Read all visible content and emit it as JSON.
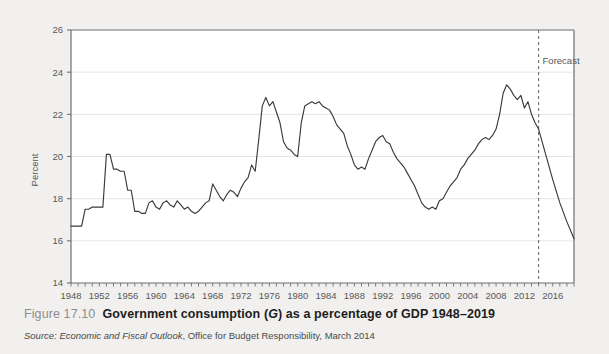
{
  "figure": {
    "number_label": "Figure 17.10",
    "title_part1": "Government consumption (",
    "title_italic": "G",
    "title_part2": ") as a percentage of GDP 1948–2019",
    "title_full": "Government consumption (G) as a percentage of GDP 1948–2019",
    "source_label": "Source:",
    "source_title": "Economic and Fiscal Outlook",
    "source_rest": ", Office for Budget Responsibility, March 2014"
  },
  "colors": {
    "page_background": "#f1f0ee",
    "plot_background": "#ffffff",
    "axis": "#6f6f71",
    "gridline": "#e2e2e2",
    "series_line": "#3a3a3c",
    "forecast_divider": "#6f6f71",
    "tick_label": "#58585a"
  },
  "chart_data": {
    "type": "line",
    "title": "Government consumption (G) as a percentage of GDP 1948–2019",
    "xlabel": "",
    "ylabel": "Percent",
    "xlim": [
      1948,
      2019
    ],
    "ylim": [
      14,
      26
    ],
    "yticks": [
      14,
      16,
      18,
      20,
      22,
      24,
      26
    ],
    "ytick_labels": [
      "14",
      "16",
      "18",
      "20",
      "22",
      "24",
      "26"
    ],
    "xticks": [
      1948,
      1952,
      1956,
      1960,
      1964,
      1968,
      1972,
      1976,
      1980,
      1984,
      1988,
      1992,
      1996,
      2000,
      2004,
      2008,
      2012,
      2016
    ],
    "xtick_labels": [
      "1948",
      "1952",
      "1956",
      "1960",
      "1964",
      "1968",
      "1972",
      "1976",
      "1980",
      "1984",
      "1988",
      "1992",
      "1996",
      "2000",
      "2004",
      "2008",
      "2012",
      "2016"
    ],
    "xtick_minor_step": 1,
    "grid": "horizontal",
    "legend": "none",
    "annotations": [
      {
        "name": "forecast-label",
        "text": "Forecast",
        "x": 2014.0,
        "y": 24.4,
        "kind": "text"
      },
      {
        "name": "forecast-divider",
        "text": "",
        "x": 2014.0,
        "kind": "vertical-dashed-line"
      }
    ],
    "series": [
      {
        "name": "Government consumption as % of GDP",
        "x": [
          1948.0,
          1948.5,
          1949.0,
          1949.5,
          1950.0,
          1950.5,
          1951.0,
          1951.5,
          1952.0,
          1952.5,
          1953.0,
          1953.5,
          1954.0,
          1954.5,
          1955.0,
          1955.5,
          1956.0,
          1956.5,
          1957.0,
          1957.5,
          1958.0,
          1958.5,
          1959.0,
          1959.5,
          1960.0,
          1960.5,
          1961.0,
          1961.5,
          1962.0,
          1962.5,
          1963.0,
          1963.5,
          1964.0,
          1964.5,
          1965.0,
          1965.5,
          1966.0,
          1966.5,
          1967.0,
          1967.5,
          1968.0,
          1968.5,
          1969.0,
          1969.5,
          1970.0,
          1970.5,
          1971.0,
          1971.5,
          1972.0,
          1972.5,
          1973.0,
          1973.5,
          1974.0,
          1974.5,
          1975.0,
          1975.5,
          1976.0,
          1976.5,
          1977.0,
          1977.5,
          1978.0,
          1978.5,
          1979.0,
          1979.5,
          1980.0,
          1980.5,
          1981.0,
          1981.5,
          1982.0,
          1982.5,
          1983.0,
          1983.5,
          1984.0,
          1984.5,
          1985.0,
          1985.5,
          1986.0,
          1986.5,
          1987.0,
          1987.5,
          1988.0,
          1988.5,
          1989.0,
          1989.5,
          1990.0,
          1990.5,
          1991.0,
          1991.5,
          1992.0,
          1992.5,
          1993.0,
          1993.5,
          1994.0,
          1994.5,
          1995.0,
          1995.5,
          1996.0,
          1996.5,
          1997.0,
          1997.5,
          1998.0,
          1998.5,
          1999.0,
          1999.5,
          2000.0,
          2000.5,
          2001.0,
          2001.5,
          2002.0,
          2002.5,
          2003.0,
          2003.5,
          2004.0,
          2004.5,
          2005.0,
          2005.5,
          2006.0,
          2006.5,
          2007.0,
          2007.5,
          2008.0,
          2008.5,
          2009.0,
          2009.5,
          2010.0,
          2010.5,
          2011.0,
          2011.5,
          2012.0,
          2012.5,
          2013.0,
          2013.5,
          2014.0,
          2015.0,
          2016.0,
          2017.0,
          2018.0,
          2019.0
        ],
        "y": [
          16.7,
          16.7,
          16.7,
          16.7,
          17.5,
          17.5,
          17.6,
          17.6,
          17.6,
          17.6,
          20.1,
          20.1,
          19.4,
          19.4,
          19.3,
          19.3,
          18.4,
          18.4,
          17.4,
          17.4,
          17.3,
          17.3,
          17.8,
          17.9,
          17.6,
          17.5,
          17.8,
          17.9,
          17.7,
          17.6,
          17.9,
          17.7,
          17.5,
          17.6,
          17.4,
          17.3,
          17.4,
          17.6,
          17.8,
          17.9,
          18.7,
          18.4,
          18.1,
          17.9,
          18.2,
          18.4,
          18.3,
          18.1,
          18.5,
          18.8,
          19.0,
          19.6,
          19.3,
          20.8,
          22.4,
          22.8,
          22.4,
          22.6,
          22.1,
          21.6,
          20.7,
          20.4,
          20.3,
          20.1,
          20.0,
          21.6,
          22.4,
          22.5,
          22.6,
          22.5,
          22.6,
          22.4,
          22.3,
          22.2,
          21.9,
          21.5,
          21.3,
          21.1,
          20.5,
          20.1,
          19.6,
          19.4,
          19.5,
          19.4,
          19.9,
          20.3,
          20.7,
          20.9,
          21.0,
          20.7,
          20.6,
          20.2,
          19.9,
          19.7,
          19.5,
          19.2,
          18.9,
          18.6,
          18.2,
          17.8,
          17.6,
          17.5,
          17.6,
          17.5,
          17.9,
          18.0,
          18.3,
          18.6,
          18.8,
          19.0,
          19.4,
          19.6,
          19.9,
          20.1,
          20.3,
          20.6,
          20.8,
          20.9,
          20.8,
          21.0,
          21.3,
          22.0,
          23.0,
          23.4,
          23.2,
          22.9,
          22.7,
          22.9,
          22.3,
          22.6,
          22.0,
          21.6,
          21.3,
          20.1,
          18.9,
          17.8,
          16.9,
          16.1
        ]
      }
    ],
    "forecast_start_year": 2014.0,
    "forecast_note": "Values from 2014 onward are forecast (right of dashed divider)."
  }
}
